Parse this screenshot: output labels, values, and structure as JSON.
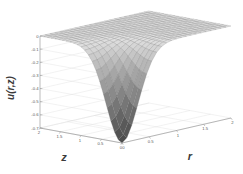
{
  "figure": {
    "kind": "3d-surface-plot",
    "background_color": "#ffffff",
    "surface_light_color": "#e2e2e2",
    "surface_dark_color": "#555555",
    "mesh_color": "#6f6f6f",
    "axis_color": "#8d8d8d",
    "tick_label_color": "#5a5a5a",
    "axis_title_color": "#3b3b3b"
  },
  "chart_data": {
    "type": "surface",
    "title": "",
    "xlabel": "r",
    "ylabel": "z",
    "zlabel": "u(r,z)",
    "grid": true,
    "legend": "none",
    "xlim": [
      0,
      2
    ],
    "ylim": [
      0,
      2
    ],
    "zlim": [
      -0.7,
      0
    ],
    "x_ticks": [
      "0",
      "0.5",
      "1",
      "1.5",
      "2"
    ],
    "x_tick_values": [
      0,
      0.5,
      1,
      1.5,
      2
    ],
    "y_ticks": [
      "2",
      "1.5",
      "1",
      "0.5",
      "0"
    ],
    "y_tick_values": [
      2,
      1.5,
      1,
      0.5,
      0
    ],
    "z_ticks": [
      "0",
      "-0.1",
      "-0.2",
      "-0.3",
      "-0.4",
      "-0.5",
      "-0.6",
      "-0.7"
    ],
    "z_tick_values": [
      0,
      -0.1,
      -0.2,
      -0.3,
      -0.4,
      -0.5,
      -0.6,
      -0.7
    ],
    "x": [
      0,
      0.1,
      0.2,
      0.3,
      0.4,
      0.5,
      0.6,
      0.7,
      0.8,
      0.9,
      1,
      1.1,
      1.2,
      1.3,
      1.4,
      1.5,
      1.6,
      1.7,
      1.8,
      1.9,
      2
    ],
    "y": [
      0,
      0.1,
      0.2,
      0.3,
      0.4,
      0.5,
      0.6,
      0.7,
      0.8,
      0.9,
      1,
      1.1,
      1.2,
      1.3,
      1.4,
      1.5,
      1.6,
      1.7,
      1.8,
      1.9,
      2
    ],
    "z_description": "u(r,z) is near 0 over most of the domain, forming a nearly flat plateau, and plunges steeply to about -0.7 in the corner near r=0, z=0.",
    "z_min": -0.7,
    "z_max": 0,
    "surface_values_note": "Values sampled on the 21x21 (r,z) grid; computed by the template from the analytic form u = -0.7*exp(-(r/0.42)^2)*exp(-(z/0.55)^2) clipped to [-0.7, 0].",
    "shading": "grayscale, darker where u is most negative"
  },
  "axis_titles": {
    "z_axis": "z",
    "r_axis": "r",
    "vertical_axis": "u(r,z)"
  }
}
